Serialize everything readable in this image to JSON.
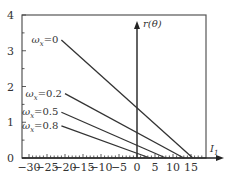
{
  "chart_data": {
    "type": "line",
    "title": "",
    "xlabel": "I_1",
    "ylabel": "r(θ)",
    "xlim": [
      -30,
      19
    ],
    "ylim": [
      0,
      4
    ],
    "x_ticks": [
      -30,
      -25,
      -20,
      -15,
      -10,
      -5,
      0,
      5,
      10,
      15
    ],
    "x_tick_labels": [
      "−30",
      "−25",
      "−20",
      "−15",
      "−10",
      "−5",
      "0",
      "5",
      "10",
      "15"
    ],
    "y_ticks": [
      0,
      1,
      2,
      3,
      4
    ],
    "y_tick_labels": [
      "0",
      "1",
      "2",
      "3",
      "4"
    ],
    "grid": false,
    "series": [
      {
        "name": "ω_x=0",
        "label_main": "ω",
        "label_sub": "x",
        "label_val": "=0",
        "x": [
          -21,
          15.5
        ],
        "y": [
          3.3,
          0
        ]
      },
      {
        "name": "ω_x=0.2",
        "label_main": "ω",
        "label_sub": "x",
        "label_val": "=0.2",
        "x": [
          -20,
          13
        ],
        "y": [
          1.8,
          0
        ]
      },
      {
        "name": "ω_x=0.5",
        "label_main": "ω",
        "label_sub": "x",
        "label_val": "=0.5",
        "x": [
          -21,
          8
        ],
        "y": [
          1.28,
          0
        ]
      },
      {
        "name": "ω_x=0.8",
        "label_main": "ω",
        "label_sub": "x",
        "label_val": "=0.8",
        "x": [
          -21,
          3.6
        ],
        "y": [
          0.9,
          0
        ]
      }
    ]
  },
  "axes": {
    "x_label_main": "I",
    "x_label_sub": "1",
    "y_label": "r(θ)"
  }
}
